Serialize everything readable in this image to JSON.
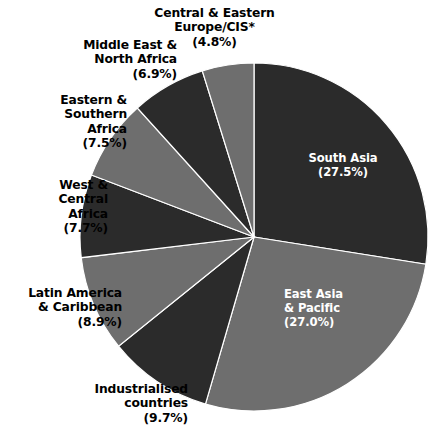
{
  "chart_data": {
    "type": "pie",
    "title": "",
    "subtitle": "",
    "legend_position": "outside-labels",
    "start_angle_deg": 0,
    "direction": "clockwise",
    "colors": {
      "dark": "#2b2b2b",
      "gray": "#6e6e6e",
      "background": "#ffffff",
      "label_dark": "#000000",
      "label_light": "#ffffff"
    },
    "categories": [
      "South Asia",
      "East Asia & Pacific",
      "Industrialised countries",
      "Latin America & Caribbean",
      "West & Central Africa",
      "Eastern & Southern Africa",
      "Middle East & North Africa",
      "Central & Eastern Europe/CIS*"
    ],
    "values": [
      27.5,
      27.0,
      9.7,
      8.9,
      7.7,
      7.5,
      6.9,
      4.8
    ],
    "units": "percent",
    "slices": [
      {
        "name": "South Asia",
        "value": 27.5,
        "value_label": "(27.5%)",
        "color": "#2b2b2b",
        "label_placement": "inside",
        "label_color": "#ffffff",
        "label_text": "South Asia\n(27.5%)"
      },
      {
        "name": "East Asia & Pacific",
        "value": 27.0,
        "value_label": "(27.0%)",
        "color": "#6e6e6e",
        "label_placement": "inside",
        "label_color": "#ffffff",
        "label_text": "East Asia\n& Pacific\n(27.0%)"
      },
      {
        "name": "Industrialised countries",
        "value": 9.7,
        "value_label": "(9.7%)",
        "color": "#2b2b2b",
        "label_placement": "outside",
        "label_color": "#000000",
        "label_text": "Industrialised\ncountries\n(9.7%)"
      },
      {
        "name": "Latin America & Caribbean",
        "value": 8.9,
        "value_label": "(8.9%)",
        "color": "#6e6e6e",
        "label_placement": "outside",
        "label_color": "#000000",
        "label_text": "Latin America\n& Caribbean\n(8.9%)"
      },
      {
        "name": "West & Central Africa",
        "value": 7.7,
        "value_label": "(7.7%)",
        "color": "#2b2b2b",
        "label_placement": "outside",
        "label_color": "#000000",
        "label_text": "West &\nCentral\nAfrica\n(7.7%)"
      },
      {
        "name": "Eastern & Southern Africa",
        "value": 7.5,
        "value_label": "(7.5%)",
        "color": "#6e6e6e",
        "label_placement": "outside",
        "label_color": "#000000",
        "label_text": "Eastern &\nSouthern\nAfrica\n(7.5%)"
      },
      {
        "name": "Middle East & North Africa",
        "value": 6.9,
        "value_label": "(6.9%)",
        "color": "#2b2b2b",
        "label_placement": "outside",
        "label_color": "#000000",
        "label_text": "Middle East &\nNorth Africa\n(6.9%)"
      },
      {
        "name": "Central & Eastern Europe/CIS*",
        "value": 4.8,
        "value_label": "(4.8%)",
        "color": "#6e6e6e",
        "label_placement": "outside",
        "label_color": "#000000",
        "label_text": "Central & Eastern\nEurope/CIS*\n(4.8%)"
      }
    ],
    "geometry": {
      "center_x": 254,
      "center_y": 237,
      "radius": 174
    }
  }
}
